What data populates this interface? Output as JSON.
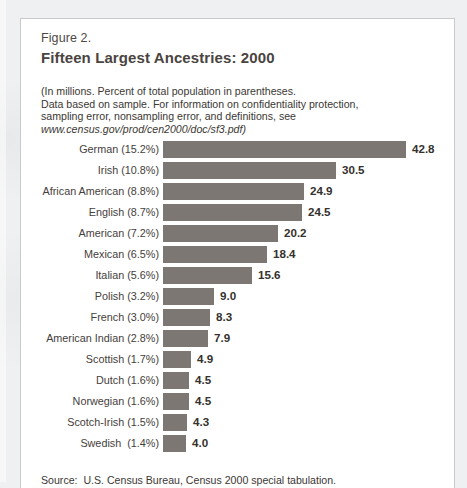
{
  "figure": {
    "number": "Figure 2.",
    "title": "Fifteen Largest Ancestries: 2000",
    "subtitle_line1": "(In millions. Percent of total population in parentheses.",
    "subtitle_line2": "Data based on sample.  For information on confidentiality protection,",
    "subtitle_line3": "sampling error, nonsampling error, and definitions, see",
    "subtitle_url": "www.census.gov/prod/cen2000/doc/sf3.pdf)",
    "source": "Source:  U.S. Census Bureau, Census 2000 special tabulation."
  },
  "colors": {
    "bar": "#7c7772",
    "title": "#4a443f",
    "text": "#3b3733",
    "page_background": "#eff0f1",
    "figure_background": "#ffffff",
    "figure_border": "#c9c9cb"
  },
  "chart_data": {
    "type": "bar",
    "orientation": "horizontal",
    "title": "Fifteen Largest Ancestries: 2000",
    "subtitle": "(In millions. Percent of total population in parentheses. Data based on sample.)",
    "xlabel": "",
    "ylabel": "",
    "units": "millions",
    "xlim": [
      0,
      42.8
    ],
    "grid": false,
    "legend": false,
    "value_labels": true,
    "categories": [
      "German (15.2%)",
      "Irish (10.8%)",
      "African American (8.8%)",
      "English (8.7%)",
      "American (7.2%)",
      "Mexican (6.5%)",
      "Italian (5.6%)",
      "Polish (3.2%)",
      "French (3.0%)",
      "American Indian (2.8%)",
      "Scottish (1.7%)",
      "Dutch (1.6%)",
      "Norwegian (1.6%)",
      "Scotch-Irish (1.5%)",
      "Swedish  (1.4%)"
    ],
    "values": [
      42.8,
      30.5,
      24.9,
      24.5,
      20.2,
      18.4,
      15.6,
      9.0,
      8.3,
      7.9,
      4.9,
      4.5,
      4.5,
      4.3,
      4.0
    ],
    "value_text": [
      "42.8",
      "30.5",
      "24.9",
      "24.5",
      "20.2",
      "18.4",
      "15.6",
      "9.0",
      "8.3",
      "7.9",
      "4.9",
      "4.5",
      "4.5",
      "4.3",
      "4.0"
    ],
    "percent_of_population": [
      15.2,
      10.8,
      8.8,
      8.7,
      7.2,
      6.5,
      5.6,
      3.2,
      3.0,
      2.8,
      1.7,
      1.6,
      1.6,
      1.5,
      1.4
    ],
    "ancestry_names": [
      "German",
      "Irish",
      "African American",
      "English",
      "American",
      "Mexican",
      "Italian",
      "Polish",
      "French",
      "American Indian",
      "Scottish",
      "Dutch",
      "Norwegian",
      "Scotch-Irish",
      "Swedish"
    ],
    "source": "U.S. Census Bureau, Census 2000 special tabulation"
  }
}
